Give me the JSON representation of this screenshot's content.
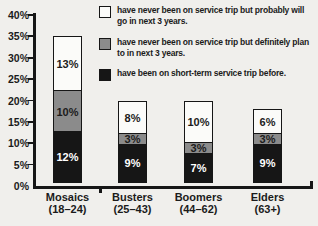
{
  "colors": {
    "background": "#f0efec",
    "axis": "#161616",
    "black": "#161616",
    "gray": "#8b8b8b",
    "white": "#fbfbf9",
    "text_on_black": "#ffffff",
    "text_on_light": "#1b1b1b"
  },
  "legend": {
    "items": [
      {
        "swatch": "white",
        "label": "have never been on service trip but probably will go in next 3 years."
      },
      {
        "swatch": "gray",
        "label": "have never been on service trip but definitely plan to in next 3 years."
      },
      {
        "swatch": "black",
        "label": "have been on short-term service trip before."
      }
    ]
  },
  "chart_data": {
    "type": "bar",
    "stacked": true,
    "categories": [
      {
        "name": "Mosaics",
        "range": "(18–24)"
      },
      {
        "name": "Busters",
        "range": "(25–43)"
      },
      {
        "name": "Boomers",
        "range": "(44–62)"
      },
      {
        "name": "Elders",
        "range": "(63+)"
      }
    ],
    "series": [
      {
        "name": "have been on short-term service trip before.",
        "color_key": "black",
        "values": [
          12,
          9,
          7,
          9
        ]
      },
      {
        "name": "have never been on service trip but definitely plan to in next 3 years.",
        "color_key": "gray",
        "values": [
          10,
          3,
          3,
          3
        ]
      },
      {
        "name": "have never been on service trip but probably will go in next 3 years.",
        "color_key": "white",
        "values": [
          13,
          8,
          10,
          6
        ]
      }
    ],
    "totals": [
      35,
      20,
      20,
      18
    ],
    "y_axis": {
      "min": 0,
      "max": 40,
      "step": 5,
      "tick_suffix": "%"
    },
    "value_label_suffix": "%",
    "legend_position": "top-right",
    "grid": false
  }
}
